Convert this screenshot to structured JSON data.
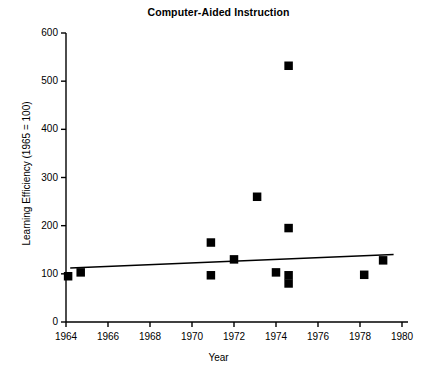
{
  "chart_data": {
    "type": "scatter",
    "title": "Computer-Aided Instruction",
    "xlabel": "Year",
    "ylabel": "Learning Efficiency (1965 = 100)",
    "xlim": [
      1964,
      1980
    ],
    "ylim": [
      0,
      600
    ],
    "xticks": [
      1964,
      1966,
      1968,
      1970,
      1972,
      1974,
      1976,
      1978,
      1980
    ],
    "yticks": [
      0,
      100,
      200,
      300,
      400,
      500,
      600
    ],
    "grid": false,
    "legend": null,
    "marker": "filled-square",
    "marker_color": "#000000",
    "series": [
      {
        "name": "Learning Efficiency",
        "points": [
          {
            "x": 1964.1,
            "y": 95
          },
          {
            "x": 1964.7,
            "y": 103
          },
          {
            "x": 1970.9,
            "y": 165
          },
          {
            "x": 1970.9,
            "y": 97
          },
          {
            "x": 1972.0,
            "y": 130
          },
          {
            "x": 1973.1,
            "y": 260
          },
          {
            "x": 1974.0,
            "y": 103
          },
          {
            "x": 1974.6,
            "y": 532
          },
          {
            "x": 1974.6,
            "y": 195
          },
          {
            "x": 1974.6,
            "y": 97
          },
          {
            "x": 1974.6,
            "y": 80
          },
          {
            "x": 1978.2,
            "y": 98
          },
          {
            "x": 1979.1,
            "y": 128
          }
        ]
      }
    ],
    "trendline": {
      "type": "line",
      "x": [
        1964.2,
        1979.6
      ],
      "y": [
        112,
        140
      ]
    }
  }
}
